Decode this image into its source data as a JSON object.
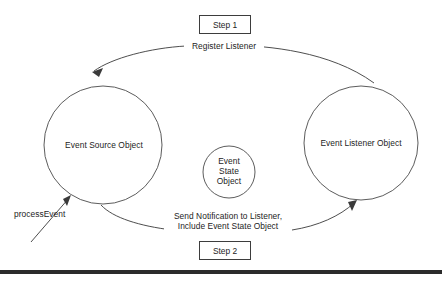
{
  "diagram": {
    "background_color": "#ffffff",
    "line_color": "#3a3a3a",
    "text_color": "#1d1d1d",
    "nodes": {
      "source": {
        "label": "Event Source Object"
      },
      "listener": {
        "label": "Event Listener Object"
      },
      "state": {
        "line1": "Event",
        "line2": "State",
        "line3": "Object"
      }
    },
    "edges": {
      "register": {
        "label": "Register Listener"
      },
      "notify": {
        "line1": "Send Notification to Listener,",
        "line2": "Include Event State Object"
      },
      "process": {
        "label": "processEvent"
      }
    },
    "steps": {
      "step1": "Step 1",
      "step2": "Step 2"
    }
  }
}
